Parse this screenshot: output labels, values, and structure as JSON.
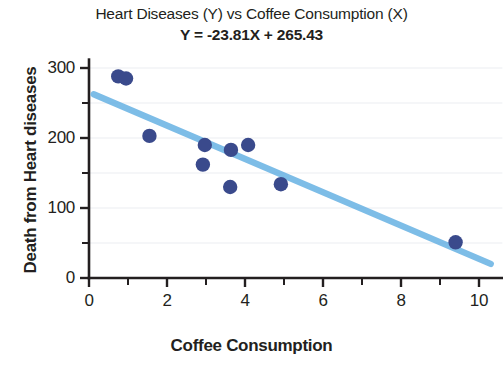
{
  "chart_data": {
    "type": "scatter",
    "title": "Heart Diseases (Y) vs Coffee Consumption (X)",
    "subtitle": "Y = -23.81X + 265.43",
    "xlabel": "Coffee Consumption",
    "ylabel": "Death from Heart diseases",
    "xlim": [
      0,
      10.6
    ],
    "ylim": [
      0,
      312
    ],
    "xticks": [
      0,
      2,
      4,
      6,
      8,
      10
    ],
    "xtick_labels": [
      "0",
      "2",
      "4",
      "6",
      "8",
      "10"
    ],
    "xminor_ticks": [
      1,
      3,
      5,
      7,
      9
    ],
    "yticks": [
      0,
      100,
      200,
      300
    ],
    "ytick_labels": [
      "0",
      "100",
      "200",
      "300"
    ],
    "yminor_ticks": [
      50,
      150,
      250
    ],
    "grid": "horizontal-minor-faint",
    "legend": "none",
    "marker_color": "#3a4a8c",
    "line_color": "#6cb4e4",
    "axis_color": "#231f20",
    "grid_color": "#eceef2",
    "points": [
      {
        "x": 0.75,
        "y": 288
      },
      {
        "x": 0.95,
        "y": 285
      },
      {
        "x": 1.55,
        "y": 203
      },
      {
        "x": 2.97,
        "y": 190
      },
      {
        "x": 2.92,
        "y": 162
      },
      {
        "x": 3.64,
        "y": 183
      },
      {
        "x": 3.62,
        "y": 130
      },
      {
        "x": 4.08,
        "y": 190
      },
      {
        "x": 4.92,
        "y": 134
      },
      {
        "x": 9.4,
        "y": 51
      }
    ],
    "regression_line": {
      "slope": -23.81,
      "intercept": 265.43,
      "x_start": 0.12,
      "x_end": 10.3
    }
  }
}
